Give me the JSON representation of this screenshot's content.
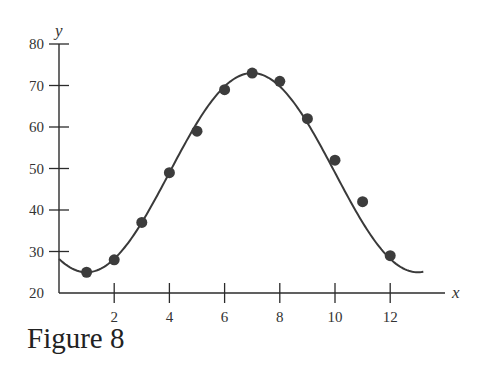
{
  "caption": "Figure 8",
  "colors": {
    "axis": "#2b2b2b",
    "curve": "#3a3a3a",
    "point": "#3c3c3c",
    "text": "#333333"
  },
  "chart_data": {
    "type": "scatter",
    "title": "Figure 8",
    "xlabel": "x",
    "ylabel": "y",
    "xlim": [
      0,
      14
    ],
    "ylim": [
      20,
      80
    ],
    "grid": false,
    "legend": null,
    "x_ticks": [
      2,
      4,
      6,
      8,
      10,
      12
    ],
    "x_tick_labels": [
      "2",
      "4",
      "6",
      "8",
      "10",
      "12"
    ],
    "y_ticks": [
      20,
      30,
      40,
      50,
      60,
      70,
      80
    ],
    "y_tick_labels": [
      "20",
      "30",
      "40",
      "50",
      "60",
      "70",
      "80"
    ],
    "series": [
      {
        "name": "data points",
        "kind": "scatter",
        "x": [
          1,
          2,
          3,
          4,
          5,
          6,
          7,
          8,
          9,
          10,
          11,
          12
        ],
        "y": [
          25,
          28,
          37,
          49,
          59,
          69,
          73,
          71,
          62,
          52,
          42,
          29
        ]
      },
      {
        "name": "fitted sinusoid",
        "kind": "line",
        "model": "y = 49 + 24*sin(pi*(x-4)/6)",
        "x_range": [
          0,
          13.2
        ],
        "amplitude": 24,
        "midline": 49,
        "period": 12,
        "phase_shift": 4
      }
    ]
  }
}
